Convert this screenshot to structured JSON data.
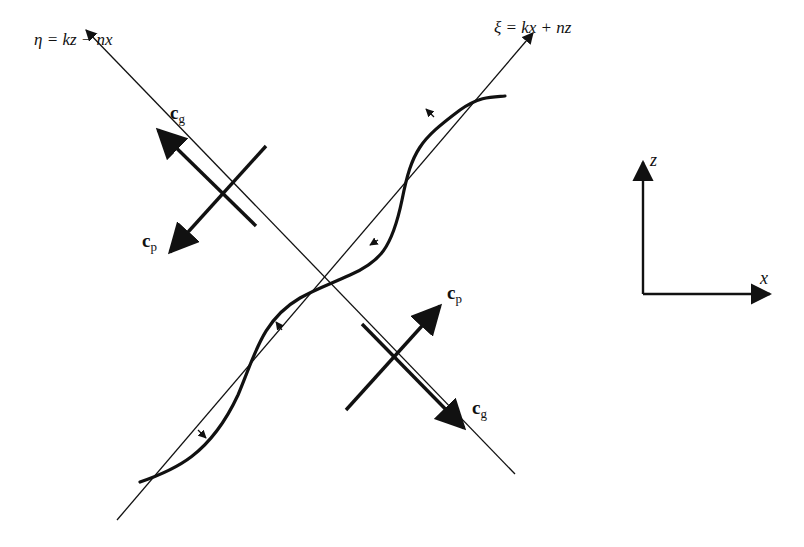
{
  "diagram": {
    "axes": {
      "eta_label": "η = kz − nx",
      "xi_label": "ξ = kx + nz"
    },
    "vectors": {
      "upper_left": {
        "group": "c",
        "group_sub": "g",
        "phase": "c",
        "phase_sub": "p"
      },
      "lower_right": {
        "group": "c",
        "group_sub": "g",
        "phase": "c",
        "phase_sub": "p"
      }
    },
    "reference_axes": {
      "vertical": "z",
      "horizontal": "x"
    },
    "colors": {
      "line": "#111111",
      "background": "#ffffff"
    }
  }
}
